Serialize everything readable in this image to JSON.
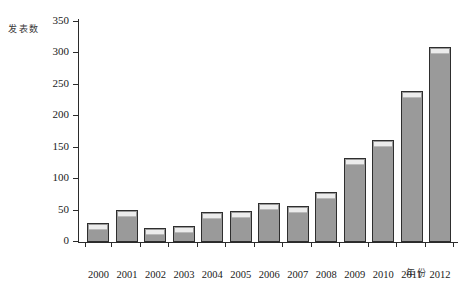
{
  "chart_data": {
    "type": "bar",
    "title": "",
    "subtitle": "",
    "xlabel": "年份",
    "ylabel": "发表数",
    "categories": [
      "2000",
      "2001",
      "2002",
      "2003",
      "2004",
      "2005",
      "2006",
      "2007",
      "2008",
      "2009",
      "2010",
      "2011",
      "2012"
    ],
    "values": [
      31,
      51,
      22,
      25,
      48,
      49,
      62,
      57,
      79,
      134,
      163,
      241,
      310
    ],
    "ylim": [
      0,
      350
    ],
    "yticks": [
      0,
      50,
      100,
      150,
      200,
      250,
      300,
      350
    ],
    "ytick_labels": [
      "0",
      "50",
      "100",
      "150",
      "200",
      "250",
      "300",
      "350"
    ],
    "grid": false,
    "legend": null,
    "legend_position": "none",
    "bar_fill_color": "#9a9a9a",
    "bar_border_color": "#2e2e2e",
    "bar_highlight_color": "#ececec",
    "axis_color": "#2b2b2b",
    "background_color": "#ffffff"
  }
}
